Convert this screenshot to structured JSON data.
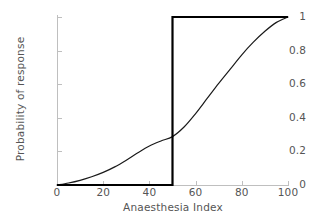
{
  "chart_data": {
    "type": "line",
    "title": "",
    "xlabel": "Anaesthesia Index",
    "ylabel": "Probability of response",
    "xlim": [
      0,
      100
    ],
    "ylim": [
      0,
      1
    ],
    "grid": false,
    "legend": "none",
    "xticks": [
      "0",
      "20",
      "40",
      "60",
      "80",
      "100"
    ],
    "xtick_values": [
      0,
      20,
      40,
      60,
      80,
      100
    ],
    "yticks": [
      "0",
      "0.2",
      "0.4",
      "0.6",
      "0.8",
      "1"
    ],
    "ytick_values": [
      0,
      0.2,
      0.4,
      0.6,
      0.8,
      1
    ],
    "series": [
      {
        "name": "sigmoid-response-curve",
        "style": "smooth",
        "color": "#1a1a1a",
        "linewidth": 1.2,
        "x": [
          0,
          5,
          10,
          15,
          20,
          25,
          30,
          35,
          40,
          45,
          50,
          55,
          60,
          65,
          70,
          75,
          80,
          85,
          90,
          95,
          100
        ],
        "values": [
          0.0,
          0.012,
          0.028,
          0.049,
          0.075,
          0.108,
          0.148,
          0.192,
          0.232,
          0.262,
          0.288,
          0.345,
          0.425,
          0.515,
          0.605,
          0.69,
          0.775,
          0.85,
          0.915,
          0.968,
          1.0
        ]
      },
      {
        "name": "step-threshold-curve",
        "style": "step",
        "color": "#000000",
        "linewidth": 2.2,
        "threshold": 50,
        "x": [
          0,
          50,
          50,
          100
        ],
        "values": [
          0,
          0,
          1,
          1
        ]
      }
    ]
  },
  "axes": {
    "x_title": "Anaesthesia Index",
    "y_title": "Probability of response"
  }
}
